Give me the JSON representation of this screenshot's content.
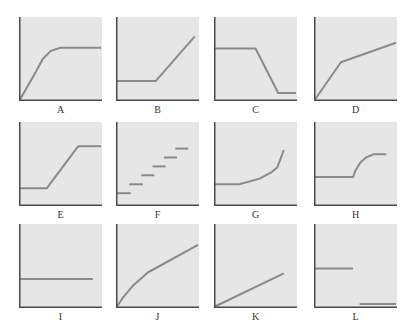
{
  "colors": {
    "background": "#ffffff",
    "panel_fill": "#e6e6e6",
    "axis": "#4a4a4a",
    "curve": "#8a8a8a"
  },
  "layout": {
    "columns_x": [
      19,
      116,
      214,
      314
    ],
    "rows_y": [
      17,
      122,
      224
    ],
    "panel_width": 83,
    "panel_height": 84
  },
  "chart_data": [
    {
      "label": "A",
      "type": "line",
      "xlabel": "",
      "ylabel": "",
      "description": "rises steeply then levels off (plateau)",
      "segments": [
        [
          [
            0,
            0
          ],
          [
            20,
            35
          ],
          [
            28,
            50
          ],
          [
            38,
            60
          ],
          [
            50,
            64
          ],
          [
            100,
            64
          ]
        ]
      ]
    },
    {
      "label": "B",
      "type": "line",
      "xlabel": "",
      "ylabel": "",
      "description": "flat then rises linearly",
      "segments": [
        [
          [
            0,
            23
          ],
          [
            48,
            23
          ],
          [
            96,
            78
          ]
        ]
      ]
    },
    {
      "label": "C",
      "type": "line",
      "xlabel": "",
      "ylabel": "",
      "description": "flat high, falls linearly, flat low",
      "segments": [
        [
          [
            0,
            63
          ],
          [
            50,
            63
          ],
          [
            78,
            8
          ],
          [
            100,
            8
          ]
        ]
      ]
    },
    {
      "label": "D",
      "type": "line",
      "xlabel": "",
      "ylabel": "",
      "description": "steep rise then shallower linear rise",
      "segments": [
        [
          [
            0,
            0
          ],
          [
            32,
            46
          ],
          [
            100,
            70
          ]
        ]
      ]
    },
    {
      "label": "E",
      "type": "line",
      "xlabel": "",
      "ylabel": "",
      "description": "flat low, linear rise, flat high",
      "segments": [
        [
          [
            0,
            20
          ],
          [
            33,
            20
          ],
          [
            72,
            72
          ],
          [
            100,
            72
          ]
        ]
      ]
    },
    {
      "label": "F",
      "type": "line",
      "xlabel": "",
      "ylabel": "",
      "description": "staircase of discrete horizontal steps",
      "segments": [
        [
          [
            0,
            14
          ],
          [
            17,
            14
          ]
        ],
        [
          [
            15,
            25
          ],
          [
            32,
            25
          ]
        ],
        [
          [
            30,
            36
          ],
          [
            46,
            36
          ]
        ],
        [
          [
            44,
            47
          ],
          [
            60,
            47
          ]
        ],
        [
          [
            58,
            58
          ],
          [
            74,
            58
          ]
        ],
        [
          [
            72,
            69
          ],
          [
            88,
            69
          ]
        ]
      ]
    },
    {
      "label": "G",
      "type": "line",
      "xlabel": "",
      "ylabel": "",
      "description": "flat then accelerating (exponential-like) rise",
      "segments": [
        [
          [
            0,
            25
          ],
          [
            30,
            25
          ],
          [
            55,
            32
          ],
          [
            70,
            40
          ],
          [
            77,
            46
          ],
          [
            85,
            67
          ]
        ]
      ]
    },
    {
      "label": "H",
      "type": "line",
      "xlabel": "",
      "ylabel": "",
      "description": "flat then rises and levels off",
      "segments": [
        [
          [
            0,
            34
          ],
          [
            47,
            34
          ],
          [
            50,
            42
          ],
          [
            56,
            52
          ],
          [
            63,
            58
          ],
          [
            72,
            62
          ],
          [
            88,
            62
          ]
        ]
      ]
    },
    {
      "label": "I",
      "type": "line",
      "xlabel": "",
      "ylabel": "",
      "description": "constant horizontal line",
      "segments": [
        [
          [
            0,
            34
          ],
          [
            90,
            34
          ]
        ]
      ]
    },
    {
      "label": "J",
      "type": "line",
      "xlabel": "",
      "ylabel": "",
      "description": "concave rise (decelerating)",
      "segments": [
        [
          [
            0,
            0
          ],
          [
            8,
            12
          ],
          [
            20,
            26
          ],
          [
            38,
            42
          ],
          [
            100,
            76
          ]
        ]
      ]
    },
    {
      "label": "K",
      "type": "line",
      "xlabel": "",
      "ylabel": "",
      "description": "steady linear rise",
      "segments": [
        [
          [
            0,
            0
          ],
          [
            85,
            41
          ]
        ]
      ]
    },
    {
      "label": "L",
      "type": "line",
      "xlabel": "",
      "ylabel": "",
      "description": "flat high then drops to flat near zero (discontinuous)",
      "segments": [
        [
          [
            0,
            47
          ],
          [
            47,
            47
          ]
        ],
        [
          [
            55,
            3
          ],
          [
            100,
            3
          ]
        ]
      ]
    }
  ]
}
